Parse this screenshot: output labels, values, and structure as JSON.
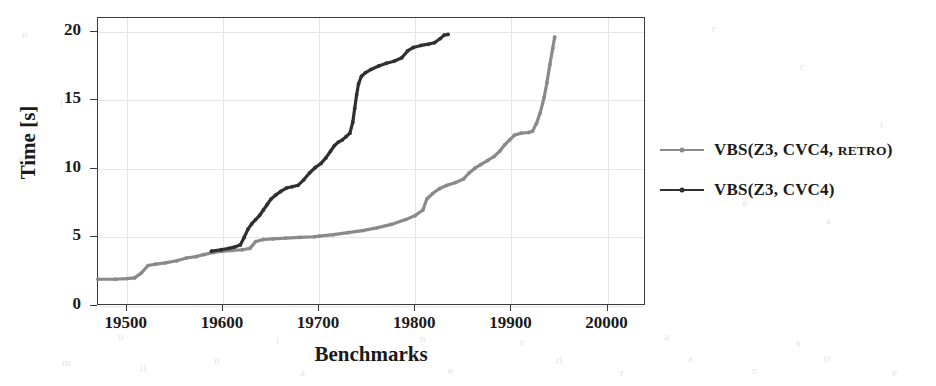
{
  "chart_data": {
    "type": "line",
    "title": "",
    "xlabel": "Benchmarks",
    "ylabel": "Time [s]",
    "xlim": [
      19470,
      20040
    ],
    "ylim": [
      0,
      21
    ],
    "xticks": [
      19500,
      19600,
      19700,
      19800,
      19900,
      20000
    ],
    "yticks": [
      0,
      5,
      10,
      15,
      20
    ],
    "grid": true,
    "legend_position": "right",
    "series": [
      {
        "name": "VBS(Z3, CVC4, Retro)",
        "name_parts": {
          "main": "VBS(Z3, CVC4, ",
          "smallcaps": "Retro",
          "tail": ")"
        },
        "color": "#8a8a8a",
        "points": [
          [
            19470,
            1.95
          ],
          [
            19488,
            1.95
          ],
          [
            19500,
            2.0
          ],
          [
            19508,
            2.05
          ],
          [
            19515,
            2.4
          ],
          [
            19522,
            2.95
          ],
          [
            19530,
            3.05
          ],
          [
            19540,
            3.15
          ],
          [
            19552,
            3.3
          ],
          [
            19562,
            3.5
          ],
          [
            19572,
            3.6
          ],
          [
            19580,
            3.75
          ],
          [
            19590,
            3.9
          ],
          [
            19600,
            4.0
          ],
          [
            19610,
            4.05
          ],
          [
            19620,
            4.1
          ],
          [
            19628,
            4.2
          ],
          [
            19634,
            4.7
          ],
          [
            19642,
            4.85
          ],
          [
            19652,
            4.9
          ],
          [
            19665,
            4.95
          ],
          [
            19680,
            5.0
          ],
          [
            19695,
            5.05
          ],
          [
            19700,
            5.1
          ],
          [
            19715,
            5.2
          ],
          [
            19730,
            5.35
          ],
          [
            19745,
            5.5
          ],
          [
            19760,
            5.7
          ],
          [
            19775,
            5.95
          ],
          [
            19790,
            6.3
          ],
          [
            19800,
            6.6
          ],
          [
            19808,
            7.0
          ],
          [
            19812,
            7.8
          ],
          [
            19818,
            8.2
          ],
          [
            19825,
            8.55
          ],
          [
            19833,
            8.8
          ],
          [
            19842,
            9.0
          ],
          [
            19850,
            9.25
          ],
          [
            19856,
            9.7
          ],
          [
            19862,
            10.05
          ],
          [
            19868,
            10.3
          ],
          [
            19875,
            10.6
          ],
          [
            19882,
            10.9
          ],
          [
            19888,
            11.3
          ],
          [
            19893,
            11.75
          ],
          [
            19898,
            12.1
          ],
          [
            19903,
            12.45
          ],
          [
            19910,
            12.6
          ],
          [
            19918,
            12.65
          ],
          [
            19922,
            12.75
          ],
          [
            19926,
            13.3
          ],
          [
            19930,
            14.1
          ],
          [
            19934,
            15.2
          ],
          [
            19937,
            16.3
          ],
          [
            19940,
            17.6
          ],
          [
            19943,
            18.8
          ],
          [
            19945,
            19.6
          ]
        ]
      },
      {
        "name": "VBS(Z3, CVC4)",
        "name_parts": {
          "main": "VBS(Z3, CVC4)",
          "smallcaps": "",
          "tail": ""
        },
        "color": "#303030",
        "points": [
          [
            19588,
            4.0
          ],
          [
            19598,
            4.1
          ],
          [
            19606,
            4.2
          ],
          [
            19612,
            4.3
          ],
          [
            19618,
            4.45
          ],
          [
            19622,
            5.0
          ],
          [
            19626,
            5.6
          ],
          [
            19630,
            6.0
          ],
          [
            19634,
            6.3
          ],
          [
            19638,
            6.6
          ],
          [
            19642,
            7.0
          ],
          [
            19646,
            7.4
          ],
          [
            19650,
            7.8
          ],
          [
            19655,
            8.1
          ],
          [
            19660,
            8.35
          ],
          [
            19666,
            8.6
          ],
          [
            19672,
            8.7
          ],
          [
            19678,
            8.8
          ],
          [
            19684,
            9.2
          ],
          [
            19690,
            9.7
          ],
          [
            19696,
            10.1
          ],
          [
            19702,
            10.4
          ],
          [
            19707,
            10.8
          ],
          [
            19712,
            11.3
          ],
          [
            19716,
            11.7
          ],
          [
            19720,
            11.95
          ],
          [
            19724,
            12.1
          ],
          [
            19728,
            12.35
          ],
          [
            19732,
            12.6
          ],
          [
            19735,
            13.4
          ],
          [
            19737,
            14.4
          ],
          [
            19739,
            15.4
          ],
          [
            19741,
            16.2
          ],
          [
            19744,
            16.75
          ],
          [
            19748,
            17.0
          ],
          [
            19754,
            17.25
          ],
          [
            19762,
            17.5
          ],
          [
            19770,
            17.7
          ],
          [
            19778,
            17.85
          ],
          [
            19786,
            18.1
          ],
          [
            19792,
            18.6
          ],
          [
            19798,
            18.85
          ],
          [
            19806,
            19.0
          ],
          [
            19814,
            19.1
          ],
          [
            19820,
            19.2
          ],
          [
            19826,
            19.5
          ],
          [
            19830,
            19.75
          ],
          [
            19834,
            19.8
          ]
        ]
      }
    ]
  },
  "axes": {
    "xtick_labels": [
      "19500",
      "19600",
      "19700",
      "19800",
      "19900",
      "20000"
    ],
    "ytick_labels": [
      "0",
      "5",
      "10",
      "15",
      "20"
    ],
    "xtitle": "Benchmarks",
    "ytitle": "Time [s]"
  },
  "legend": {
    "items": [
      {
        "label": "VBS(Z3, CVC4, Retro)",
        "prefix": "VBS(Z3, CVC4, ",
        "smallcaps": "Retro",
        "suffix": ")",
        "color": "#8a8a8a"
      },
      {
        "label": "VBS(Z3, CVC4)",
        "prefix": "VBS(Z3, CVC4)",
        "smallcaps": "",
        "suffix": "",
        "color": "#303030"
      }
    ]
  },
  "artifacts": {
    "note": "faint scanned bleed-through marks",
    "marks": [
      {
        "t": "n",
        "x": 22,
        "y": 28
      },
      {
        "t": "u",
        "x": 18,
        "y": 152
      },
      {
        "t": "i",
        "x": 60,
        "y": 96
      },
      {
        "t": "r",
        "x": 712,
        "y": 22
      },
      {
        "t": "c",
        "x": 800,
        "y": 60
      },
      {
        "t": "t",
        "x": 880,
        "y": 118
      },
      {
        "t": "e",
        "x": 742,
        "y": 196
      },
      {
        "t": "a",
        "x": 826,
        "y": 214
      },
      {
        "t": "m",
        "x": 62,
        "y": 356
      },
      {
        "t": "ll",
        "x": 140,
        "y": 362
      },
      {
        "t": "n",
        "x": 214,
        "y": 354
      },
      {
        "t": "a",
        "x": 300,
        "y": 366
      },
      {
        "t": "lt",
        "x": 372,
        "y": 352
      },
      {
        "t": "e",
        "x": 448,
        "y": 364
      },
      {
        "t": "tl",
        "x": 556,
        "y": 354
      },
      {
        "t": "r",
        "x": 620,
        "y": 366
      },
      {
        "t": "a",
        "x": 688,
        "y": 352
      },
      {
        "t": "n",
        "x": 752,
        "y": 364
      },
      {
        "t": "ti",
        "x": 824,
        "y": 352
      },
      {
        "t": "e",
        "x": 892,
        "y": 366
      },
      {
        "t": "u",
        "x": 118,
        "y": 330
      },
      {
        "t": "i",
        "x": 276,
        "y": 334
      },
      {
        "t": "n",
        "x": 420,
        "y": 332
      },
      {
        "t": "r",
        "x": 520,
        "y": 336
      },
      {
        "t": "a",
        "x": 664,
        "y": 330
      },
      {
        "t": "s",
        "x": 796,
        "y": 336
      }
    ]
  }
}
